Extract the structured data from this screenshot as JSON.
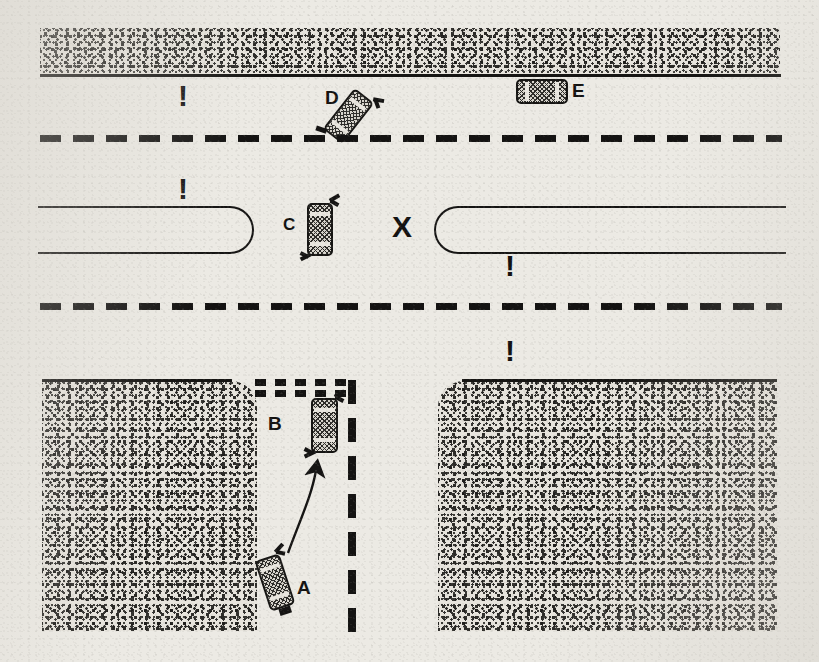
{
  "diagram": {
    "background_color": "#eceae4",
    "ink_color": "#151413",
    "width": 819,
    "height": 662
  },
  "labels": [
    {
      "id": "A",
      "text": "A",
      "x": 297,
      "y": 578,
      "size": 19
    },
    {
      "id": "B",
      "text": "B",
      "x": 268,
      "y": 414,
      "size": 19
    },
    {
      "id": "C",
      "text": "C",
      "x": 283,
      "y": 216,
      "size": 17
    },
    {
      "id": "D",
      "text": "D",
      "x": 325,
      "y": 88,
      "size": 19
    },
    {
      "id": "E",
      "text": "E",
      "x": 572,
      "y": 81,
      "size": 19
    }
  ],
  "markers": {
    "x_mark": {
      "text": "X",
      "x": 392,
      "y": 212,
      "size": 30
    },
    "exclamations": [
      {
        "id": "bang-upper-left",
        "text": "!",
        "x": 178,
        "y": 81,
        "size": 30
      },
      {
        "id": "bang-median-left",
        "text": "!",
        "x": 178,
        "y": 174,
        "size": 30
      },
      {
        "id": "bang-median-right",
        "text": "!",
        "x": 505,
        "y": 251,
        "size": 30
      },
      {
        "id": "bang-lower-right",
        "text": "!",
        "x": 505,
        "y": 336,
        "size": 30
      }
    ]
  },
  "cars": [
    {
      "id": "car-A",
      "label": "A",
      "x": 262,
      "y": 556,
      "w": 26,
      "h": 53,
      "rotate": -18
    },
    {
      "id": "car-B",
      "label": "B",
      "x": 311,
      "y": 398,
      "w": 27,
      "h": 55,
      "rotate": 0
    },
    {
      "id": "car-C",
      "label": "C",
      "x": 307,
      "y": 203,
      "w": 26,
      "h": 53,
      "rotate": 0
    },
    {
      "id": "car-D",
      "label": "D",
      "x": 336,
      "y": 90,
      "w": 25,
      "h": 52,
      "rotate": 38
    },
    {
      "id": "car-E",
      "label": "E",
      "x": 516,
      "y": 79,
      "w": 52,
      "h": 25,
      "rotate": 0
    }
  ],
  "road_features": {
    "top_curb_band": {
      "x": 40,
      "y": 28,
      "w": 740,
      "h": 47
    },
    "bottom_left_block": {
      "x": 42,
      "y": 381,
      "w": 215,
      "h": 250
    },
    "bottom_right_block": {
      "x": 438,
      "y": 381,
      "w": 339,
      "h": 250
    },
    "lane_dash_upper": {
      "x": 40,
      "y": 135,
      "w": 742
    },
    "lane_dash_lower": {
      "x": 40,
      "y": 303,
      "w": 742
    },
    "lane_dash_vertical": {
      "x": 348,
      "y": 380,
      "h": 252
    },
    "crosswalk": {
      "x": 255,
      "y": 379,
      "w": 96,
      "rows": 2
    },
    "median_left": {
      "x": 40,
      "y": 206,
      "w": 212,
      "h": 44
    },
    "median_right": {
      "x": 434,
      "y": 206,
      "w": 348,
      "h": 44
    }
  },
  "path_arrow": {
    "id": "maneuver-arrow-A-to-B",
    "description": "curved arrow from car A to car B",
    "from": "A",
    "to": "B"
  }
}
